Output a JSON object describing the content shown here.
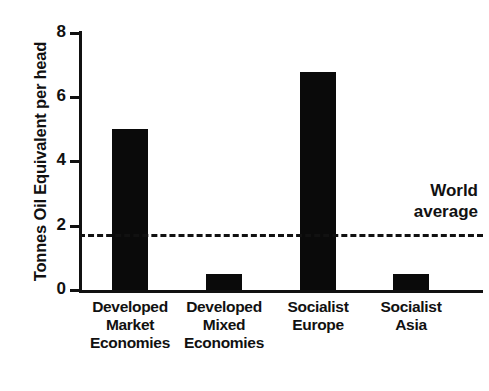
{
  "chart_data": {
    "type": "bar",
    "title": "",
    "xlabel": "",
    "ylabel": "Tonnes Oil Equivalent per head",
    "ylim": [
      0,
      8
    ],
    "yticks": [
      0,
      2,
      4,
      6,
      8
    ],
    "grid": false,
    "legend": "none",
    "categories": [
      "Developed Market Economies",
      "Developed Mixed Economies",
      "Socialist Europe",
      "Socialist Asia"
    ],
    "category_lines": [
      [
        "Developed",
        "Market",
        "Economies"
      ],
      [
        "Developed",
        "Mixed",
        "Economies"
      ],
      [
        "Socialist",
        "Europe"
      ],
      [
        "Socialist",
        "Asia"
      ]
    ],
    "values": [
      5.0,
      0.5,
      6.8,
      0.5
    ],
    "bar_color": "#0a0a0a",
    "annotations": [
      {
        "name": "world-average",
        "type": "hline",
        "value": 1.75,
        "style": "dashed",
        "label_lines": [
          "World",
          "average"
        ]
      }
    ]
  },
  "axis": {
    "tick_0": "0",
    "tick_2": "2",
    "tick_4": "4",
    "tick_6": "6",
    "tick_8": "8",
    "y_title": "Tonnes Oil Equivalent per head"
  },
  "annotation": {
    "world_average_line1": "World",
    "world_average_line2": "average"
  },
  "categories": {
    "c0_l0": "Developed",
    "c0_l1": "Market",
    "c0_l2": "Economies",
    "c1_l0": "Developed",
    "c1_l1": "Mixed",
    "c1_l2": "Economies",
    "c2_l0": "Socialist",
    "c2_l1": "Europe",
    "c3_l0": "Socialist",
    "c3_l1": "Asia"
  },
  "colors": {
    "ink": "#111111",
    "bar": "#0a0a0a",
    "background": "#ffffff"
  }
}
